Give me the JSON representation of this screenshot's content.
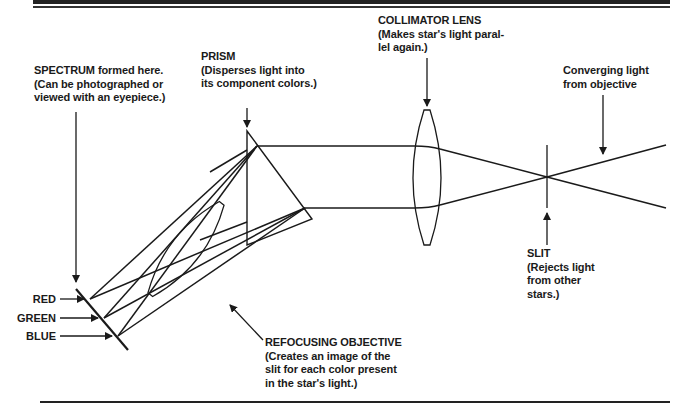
{
  "diagram": {
    "type": "optical-path",
    "components": [
      {
        "id": "collimator",
        "title": "COLLIMATOR LENS",
        "desc_lines": [
          "(Makes star's light paral-",
          "lel again.)"
        ]
      },
      {
        "id": "prism",
        "title": "PRISM",
        "desc_lines": [
          "(Disperses light into",
          "its component colors.)"
        ]
      },
      {
        "id": "spectrum",
        "title": "SPECTRUM formed here.",
        "desc_lines": [
          "(Can be photographed or",
          "viewed with an eyepiece.)"
        ]
      },
      {
        "id": "converging",
        "title": "Converging light",
        "desc_lines": [
          "from objective"
        ]
      },
      {
        "id": "slit",
        "title": "SLIT",
        "desc_lines": [
          "(Rejects light",
          "from other",
          "stars.)"
        ]
      },
      {
        "id": "refocusing",
        "title": "REFOCUSING OBJECTIVE",
        "desc_lines": [
          "(Creates an image of the",
          "slit for each color present",
          "in the star's light.)"
        ]
      }
    ],
    "colors": [
      {
        "name": "RED"
      },
      {
        "name": "GREEN"
      },
      {
        "name": "BLUE"
      }
    ],
    "line_color": "#1a1a1a"
  }
}
